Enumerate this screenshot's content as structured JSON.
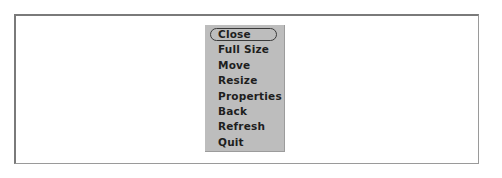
{
  "menu": {
    "items": [
      {
        "label": "Close",
        "selected": true
      },
      {
        "label": "Full Size"
      },
      {
        "label": "Move"
      },
      {
        "label": "Resize"
      },
      {
        "label": "Properties"
      },
      {
        "label": "Back"
      },
      {
        "label": "Refresh"
      },
      {
        "label": "Quit"
      }
    ]
  }
}
